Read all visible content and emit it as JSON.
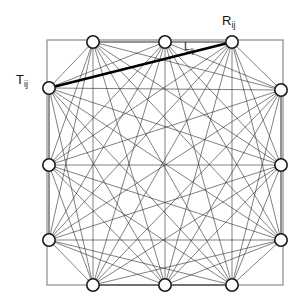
{
  "figure": {
    "name": "fully-connected-node-network-diagram",
    "background_color": "#ffffff",
    "frame": {
      "name": "square-boundary",
      "x": 47,
      "y": 40,
      "width": 236,
      "height": 245,
      "stroke": "#8a8a8a",
      "stroke_width": 1.2
    },
    "node_style": {
      "radius": 6.2,
      "fill": "#ffffff",
      "stroke": "#1a1a1a",
      "stroke_width": 1.6
    },
    "edge_style": {
      "stroke": "#2b2b2b",
      "stroke_width": 0.6
    },
    "highlight_style": {
      "stroke": "#000000",
      "stroke_width": 2.6
    },
    "nodes": [
      {
        "id": "T1",
        "label": "",
        "x": 93,
        "y": 42,
        "side": "top"
      },
      {
        "id": "T2",
        "label": "",
        "x": 165,
        "y": 42,
        "side": "top"
      },
      {
        "id": "T3",
        "label": "R_ij",
        "x": 232,
        "y": 42,
        "side": "top"
      },
      {
        "id": "R1",
        "label": "",
        "x": 281,
        "y": 90,
        "side": "right"
      },
      {
        "id": "R2",
        "label": "",
        "x": 281,
        "y": 165,
        "side": "right"
      },
      {
        "id": "R3",
        "label": "",
        "x": 281,
        "y": 240,
        "side": "right"
      },
      {
        "id": "B3",
        "label": "",
        "x": 232,
        "y": 285,
        "side": "bottom"
      },
      {
        "id": "B2",
        "label": "",
        "x": 165,
        "y": 285,
        "side": "bottom"
      },
      {
        "id": "B1",
        "label": "",
        "x": 93,
        "y": 285,
        "side": "bottom"
      },
      {
        "id": "L3",
        "label": "",
        "x": 49,
        "y": 240,
        "side": "left"
      },
      {
        "id": "L2",
        "label": "",
        "x": 49,
        "y": 165,
        "side": "left"
      },
      {
        "id": "L1",
        "label": "T_ij",
        "x": 49,
        "y": 88,
        "side": "left"
      }
    ],
    "highlighted_edge": {
      "name": "link-Lij",
      "from": "L1",
      "to": "T3",
      "label": "L"
    },
    "labels": {
      "transmitter": {
        "base": "T",
        "sub": "ij",
        "x": 16,
        "y": 84
      },
      "receiver": {
        "base": "R",
        "sub": "ij",
        "x": 222,
        "y": 25
      },
      "link": {
        "base": "L",
        "sub": "ij",
        "x": 184,
        "y": 50
      }
    }
  }
}
